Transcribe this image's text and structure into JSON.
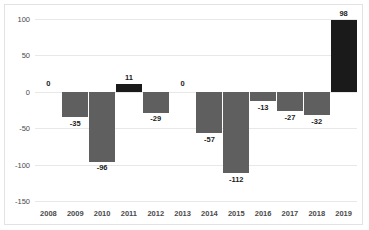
{
  "chart_data": {
    "type": "bar",
    "title": "",
    "xlabel": "",
    "ylabel": "",
    "categories": [
      "2008",
      "2009",
      "2010",
      "2011",
      "2012",
      "2013",
      "2014",
      "2015",
      "2016",
      "2017",
      "2018",
      "2019"
    ],
    "values": [
      0,
      -35,
      -96,
      11,
      -29,
      0,
      -57,
      -112,
      -13,
      -27,
      -32,
      98
    ],
    "data_labels": [
      "0",
      "-35",
      "-96",
      "11",
      "-29",
      "0",
      "-57",
      "-112",
      "-13",
      "-27",
      "-32",
      "98"
    ],
    "ylim": [
      -150,
      100
    ],
    "yticks": [
      100,
      50,
      0,
      -50,
      -100,
      -150
    ],
    "ytick_labels": [
      "100",
      "50",
      "0",
      "-50",
      "-100",
      "-150"
    ],
    "grid": true,
    "legend": "none",
    "colors": {
      "positive_bar": "#1a1a1a",
      "negative_bar": "#5f5f5f",
      "gridline": "#e8e8e8",
      "frame_border": "#e2e2e2",
      "text": "#4a4a4a",
      "background": "#ffffff"
    }
  }
}
